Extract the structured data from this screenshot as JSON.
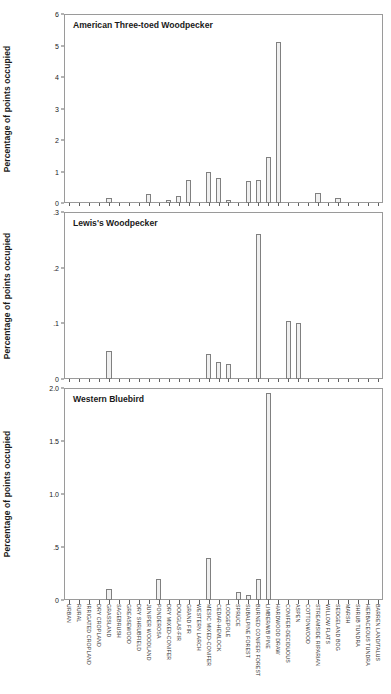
{
  "figure": {
    "axis_label": "Percentage of points occupied"
  },
  "chart_data": {
    "type": "bar",
    "title": "",
    "xlabel": "",
    "ylabel": "Percentage of points occupied",
    "grid": false,
    "legend": "none",
    "orientation": "vertical",
    "layout": "3 stacked panels sharing one categorical x-axis",
    "categories": [
      "URBAN",
      "RURAL",
      "IRRIGATED CROPLAND",
      "DRY CROPLAND",
      "GRASSLAND",
      "SAGEBRUSH",
      "GREASEWOOD",
      "DRY SHRUBFIELD",
      "JUNIPER WOODLAND",
      "PONDEROSA",
      "DRY MIXED-CONIFER",
      "DOUGLAS-FIR",
      "GRAND FIR",
      "WESTERN LARCH",
      "MESIC MIXED-CONIFER",
      "CEDAR-HEMLOCK",
      "LODGEPOLE",
      "SPRUCE",
      "SUBALPINE FOREST",
      "BURNED CONIFER FOREST",
      "LIMBER/WB PINE",
      "HARDWOOD DRAW",
      "CONIFER-DECIDUOUS",
      "ASPEN",
      "COTTONWOOD",
      "STREAMSIDE RIPARIAN",
      "WILLOW FLATS",
      "SEDGELAND BOG",
      "MARSH",
      "SHRUB TUNDRA",
      "HERBACEOUS TUNDRA",
      "BARREN LAND/TALUS"
    ],
    "panels": [
      {
        "name": "American Three-toed Woodpecker",
        "ylim": [
          0,
          6
        ],
        "yticks": [
          "0",
          "1",
          "2",
          "3",
          "4",
          "5",
          "6"
        ],
        "ytick_values": [
          0,
          1,
          2,
          3,
          4,
          5,
          6
        ],
        "values": [
          0,
          0,
          0,
          0,
          0.15,
          0,
          0,
          0,
          0.3,
          0,
          0.1,
          0.22,
          0.72,
          0,
          0.97,
          0.8,
          0.08,
          0,
          0.7,
          0.72,
          1.45,
          5.1,
          0,
          0,
          0,
          0.33,
          0,
          0.15,
          0,
          0,
          0,
          0
        ]
      },
      {
        "name": "Lewis's Woodpecker",
        "ylim": [
          0,
          0.3
        ],
        "yticks": [
          "0",
          ".1",
          ".2",
          ".3"
        ],
        "ytick_values": [
          0,
          0.1,
          0.2,
          0.3
        ],
        "values": [
          0,
          0,
          0,
          0,
          0.05,
          0,
          0,
          0,
          0,
          0,
          0,
          0,
          0,
          0,
          0.045,
          0.03,
          0.027,
          0,
          0,
          0.26,
          0,
          0,
          0.105,
          0.1,
          0,
          0,
          0,
          0,
          0,
          0,
          0,
          0
        ]
      },
      {
        "name": "Western Bluebird",
        "ylim": [
          0,
          2.0
        ],
        "yticks": [
          "0",
          ".5",
          "1.0",
          "1.5",
          "2.0"
        ],
        "ytick_values": [
          0,
          0.5,
          1.0,
          1.5,
          2.0
        ],
        "values": [
          0,
          0,
          0,
          0,
          0.1,
          0,
          0,
          0,
          0,
          0.2,
          0,
          0,
          0,
          0,
          0.4,
          0,
          0,
          0.08,
          0.05,
          0.2,
          1.95,
          0,
          0,
          0,
          0,
          0,
          0,
          0,
          0,
          0,
          0,
          0
        ]
      }
    ]
  }
}
